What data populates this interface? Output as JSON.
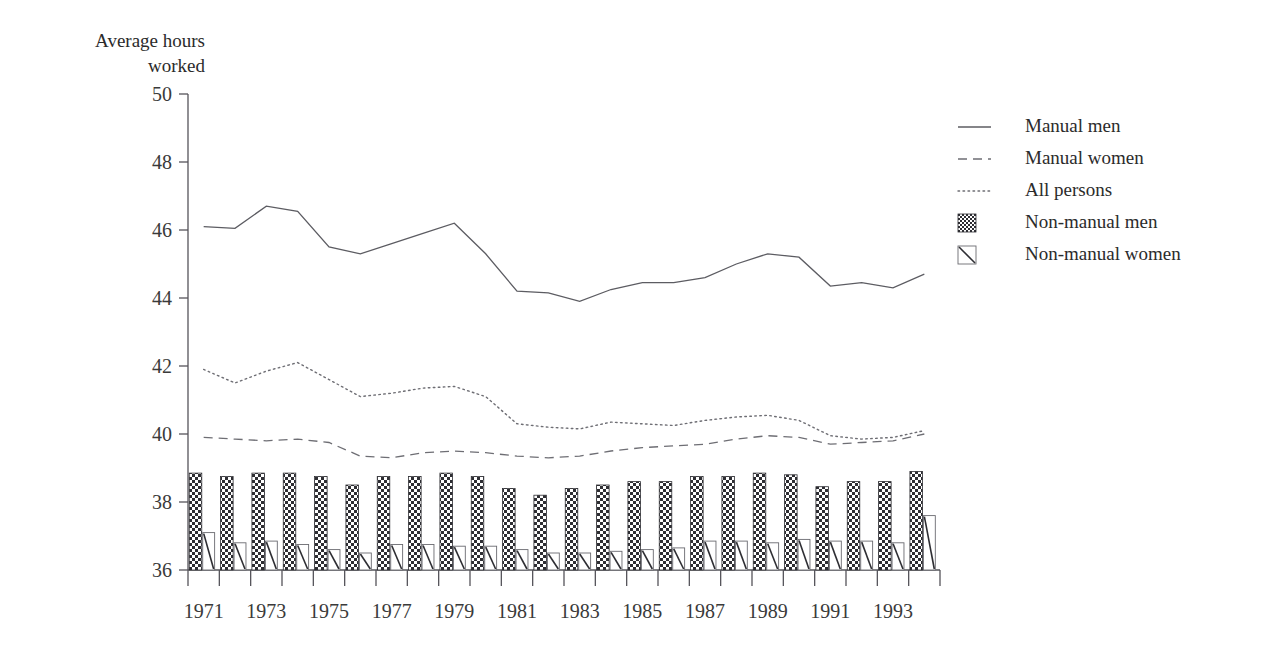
{
  "chart_data": {
    "type": "line",
    "title": "",
    "subtitle": "",
    "ylabel": "Average hours\nworked",
    "xlabel": "",
    "ylim": [
      36,
      50
    ],
    "ytick_values": [
      36,
      38,
      40,
      42,
      44,
      46,
      48,
      50
    ],
    "ytick_labels": [
      "36",
      "38",
      "40",
      "42",
      "44",
      "46",
      "48",
      "50"
    ],
    "grid": false,
    "legend_position": "right",
    "x": [
      1971,
      1972,
      1973,
      1974,
      1975,
      1976,
      1977,
      1978,
      1979,
      1980,
      1981,
      1982,
      1983,
      1984,
      1985,
      1986,
      1987,
      1988,
      1989,
      1990,
      1991,
      1992,
      1993,
      1994
    ],
    "categories": [
      "1971",
      "1972",
      "1973",
      "1974",
      "1975",
      "1976",
      "1977",
      "1978",
      "1979",
      "1980",
      "1981",
      "1982",
      "1983",
      "1984",
      "1985",
      "1986",
      "1987",
      "1988",
      "1989",
      "1990",
      "1991",
      "1992",
      "1993",
      "1994"
    ],
    "xtick_labels": [
      "1971",
      "1973",
      "1975",
      "1977",
      "1979",
      "1981",
      "1983",
      "1985",
      "1987",
      "1989",
      "1991",
      "1993"
    ],
    "xtick_label_years": [
      1971,
      1973,
      1975,
      1977,
      1979,
      1981,
      1983,
      1985,
      1987,
      1989,
      1991,
      1993
    ],
    "series": [
      {
        "name": "Manual men",
        "style": "solid-line",
        "values": [
          46.1,
          46.05,
          46.7,
          46.55,
          45.5,
          45.3,
          45.6,
          45.9,
          46.2,
          45.3,
          44.2,
          44.15,
          43.9,
          44.25,
          44.45,
          44.45,
          44.6,
          45.0,
          45.3,
          45.2,
          44.35,
          44.45,
          44.3,
          44.7
        ]
      },
      {
        "name": "Manual women",
        "style": "dashed-line",
        "values": [
          39.9,
          39.85,
          39.8,
          39.85,
          39.75,
          39.35,
          39.3,
          39.45,
          39.5,
          39.45,
          39.35,
          39.3,
          39.35,
          39.5,
          39.6,
          39.65,
          39.7,
          39.85,
          39.95,
          39.9,
          39.7,
          39.75,
          39.8,
          40.0
        ]
      },
      {
        "name": "All persons",
        "style": "dotted-line",
        "values": [
          41.9,
          41.5,
          41.85,
          42.1,
          41.6,
          41.1,
          41.2,
          41.35,
          41.4,
          41.1,
          40.3,
          40.2,
          40.15,
          40.35,
          40.3,
          40.25,
          40.4,
          40.5,
          40.55,
          40.4,
          39.95,
          39.85,
          39.9,
          40.1
        ]
      },
      {
        "name": "Non-manual men",
        "style": "bar-checkered",
        "values": [
          38.85,
          38.75,
          38.85,
          38.85,
          38.75,
          38.5,
          38.75,
          38.75,
          38.85,
          38.75,
          38.4,
          38.2,
          38.4,
          38.5,
          38.6,
          38.6,
          38.75,
          38.75,
          38.85,
          38.8,
          38.45,
          38.6,
          38.6,
          38.9
        ]
      },
      {
        "name": "Non-manual women",
        "style": "bar-diagonal",
        "values": [
          37.1,
          36.8,
          36.85,
          36.75,
          36.6,
          36.5,
          36.75,
          36.75,
          36.7,
          36.7,
          36.6,
          36.5,
          36.5,
          36.55,
          36.6,
          36.65,
          36.85,
          36.85,
          36.8,
          36.9,
          36.85,
          36.85,
          36.8,
          37.6
        ]
      }
    ],
    "legend_entries": [
      {
        "label": "Manual men",
        "swatch": "solid-line"
      },
      {
        "label": "Manual women",
        "swatch": "dashed-line"
      },
      {
        "label": "All persons",
        "swatch": "dotted-line"
      },
      {
        "label": "Non-manual men",
        "swatch": "checker-square"
      },
      {
        "label": "Non-manual women",
        "swatch": "diagonal-square"
      }
    ]
  }
}
